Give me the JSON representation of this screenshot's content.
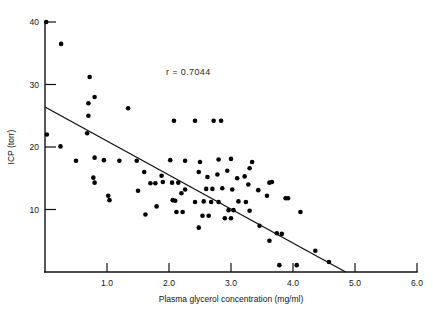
{
  "figure": {
    "background_color": "#ffffff",
    "ink_color": "#000000",
    "caption_fragment": ""
  },
  "chart_data": {
    "type": "scatter",
    "title": "",
    "xlabel": "Plasma glycerol concentration (mg/ml)",
    "ylabel": "ICP (torr)",
    "xlim": [
      0.0,
      6.0
    ],
    "ylim": [
      0,
      40
    ],
    "xticks": [
      1.0,
      2.0,
      3.0,
      4.0,
      5.0,
      6.0
    ],
    "xtick_labels": [
      "1.0",
      "2.0",
      "3.0",
      "4.0",
      "5.0",
      "6.0"
    ],
    "yticks": [
      10,
      20,
      30,
      40
    ],
    "ytick_labels": [
      "10",
      "20",
      "30",
      "40"
    ],
    "grid": false,
    "legend": "none",
    "annotations": [
      {
        "name": "correlation-coefficient",
        "text": "r = 0.7044",
        "x": 1.95,
        "y": 31.5
      }
    ],
    "fit_line": {
      "name": "regression-line",
      "label": "least-squares fit",
      "x_start": 0.0,
      "y_start": 26.4,
      "x_end": 4.85,
      "y_end": 0.0,
      "slope": -5.44,
      "intercept": 26.4
    },
    "marker": {
      "shape": "circle",
      "color": "#000000",
      "size_px": 4.6
    },
    "points": [
      [
        0.02,
        40.0
      ],
      [
        0.26,
        36.5
      ],
      [
        0.03,
        22.0
      ],
      [
        0.25,
        20.1
      ],
      [
        0.72,
        31.2
      ],
      [
        0.8,
        28.0
      ],
      [
        0.7,
        27.0
      ],
      [
        0.7,
        25.0
      ],
      [
        0.68,
        22.2
      ],
      [
        0.8,
        18.3
      ],
      [
        1.34,
        26.2
      ],
      [
        2.08,
        24.2
      ],
      [
        2.42,
        24.2
      ],
      [
        2.72,
        24.2
      ],
      [
        2.84,
        24.2
      ],
      [
        0.5,
        17.8
      ],
      [
        0.95,
        17.9
      ],
      [
        1.2,
        17.8
      ],
      [
        1.48,
        17.8
      ],
      [
        2.02,
        17.9
      ],
      [
        2.26,
        17.8
      ],
      [
        2.5,
        17.6
      ],
      [
        2.8,
        18.0
      ],
      [
        3.0,
        18.1
      ],
      [
        3.34,
        17.6
      ],
      [
        3.3,
        16.6
      ],
      [
        0.78,
        15.1
      ],
      [
        0.8,
        14.3
      ],
      [
        1.6,
        16.0
      ],
      [
        1.88,
        15.4
      ],
      [
        1.9,
        14.4
      ],
      [
        2.05,
        14.3
      ],
      [
        2.15,
        14.3
      ],
      [
        2.48,
        16.0
      ],
      [
        2.62,
        15.2
      ],
      [
        2.78,
        15.6
      ],
      [
        2.94,
        16.2
      ],
      [
        3.1,
        15.0
      ],
      [
        3.22,
        15.3
      ],
      [
        3.28,
        14.0
      ],
      [
        3.62,
        14.3
      ],
      [
        3.66,
        14.4
      ],
      [
        1.7,
        14.2
      ],
      [
        1.78,
        14.2
      ],
      [
        1.02,
        12.2
      ],
      [
        1.04,
        11.5
      ],
      [
        1.5,
        13.0
      ],
      [
        2.26,
        13.2
      ],
      [
        2.6,
        13.3
      ],
      [
        2.7,
        13.3
      ],
      [
        2.86,
        13.4
      ],
      [
        3.02,
        13.2
      ],
      [
        3.44,
        13.1
      ],
      [
        3.58,
        12.2
      ],
      [
        2.2,
        12.6
      ],
      [
        2.06,
        11.5
      ],
      [
        2.1,
        11.4
      ],
      [
        2.42,
        11.2
      ],
      [
        2.56,
        11.3
      ],
      [
        2.68,
        11.2
      ],
      [
        2.8,
        11.2
      ],
      [
        3.12,
        11.3
      ],
      [
        3.24,
        11.2
      ],
      [
        1.8,
        10.5
      ],
      [
        1.62,
        9.2
      ],
      [
        2.12,
        9.6
      ],
      [
        2.22,
        9.6
      ],
      [
        2.96,
        9.9
      ],
      [
        3.04,
        9.9
      ],
      [
        3.3,
        9.8
      ],
      [
        2.54,
        9.0
      ],
      [
        2.64,
        9.0
      ],
      [
        2.9,
        8.6
      ],
      [
        3.0,
        8.6
      ],
      [
        2.48,
        7.1
      ],
      [
        3.46,
        7.4
      ],
      [
        3.74,
        6.2
      ],
      [
        3.82,
        6.1
      ],
      [
        3.62,
        5.0
      ],
      [
        3.78,
        1.1
      ],
      [
        4.06,
        1.1
      ],
      [
        4.58,
        1.6
      ],
      [
        4.36,
        3.4
      ],
      [
        3.92,
        11.8
      ],
      [
        3.88,
        11.8
      ],
      [
        4.12,
        9.6
      ]
    ]
  }
}
